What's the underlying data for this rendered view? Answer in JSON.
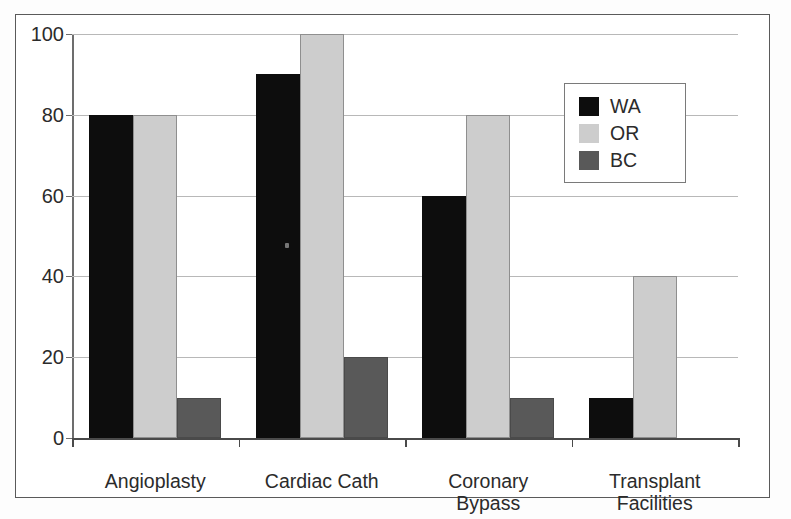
{
  "chart_data": {
    "type": "bar",
    "title": "",
    "xlabel": "",
    "ylabel": "",
    "ylim": [
      0,
      100
    ],
    "yticks": [
      0,
      20,
      40,
      60,
      80,
      100
    ],
    "grid": true,
    "legend_position": "upper right",
    "categories": [
      "Angioplasty",
      "Cardiac Cath",
      "Coronary\nBypass",
      "Transplant\nFacilities"
    ],
    "series": [
      {
        "name": "WA",
        "color": "#0d0d0d",
        "values": [
          80,
          90,
          60,
          10
        ]
      },
      {
        "name": "OR",
        "color": "#cdcdcd",
        "values": [
          80,
          100,
          80,
          40
        ]
      },
      {
        "name": "BC",
        "color": "#595959",
        "values": [
          10,
          20,
          10,
          0
        ]
      }
    ]
  },
  "axis": {
    "ytick_labels": [
      "100",
      "80",
      "60",
      "40",
      "20",
      "0"
    ]
  },
  "legend": {
    "entries": [
      {
        "label": "WA",
        "swatch": "black-swatch-icon"
      },
      {
        "label": "OR",
        "swatch": "light-gray-swatch-icon"
      },
      {
        "label": "BC",
        "swatch": "dark-gray-swatch-icon"
      }
    ]
  },
  "xaxis": {
    "labels": [
      "Angioplasty",
      "Cardiac Cath",
      "Coronary\nBypass",
      "Transplant\nFacilities"
    ]
  }
}
